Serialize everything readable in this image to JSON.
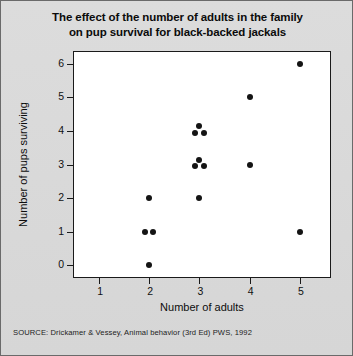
{
  "figure": {
    "title_line1": "The effect of the number of adults in the family",
    "title_line2": "on pup survival for black-backed jackals",
    "source": "SOURCE:   Drickamer & Vessey, Animal behavior (3rd Ed) PWS, 1992",
    "frame_color": "#1a1a1a",
    "marker_color": "#141414",
    "plot_background": "#ffffff",
    "page_background": "#d9d9d9"
  },
  "chart_data": {
    "type": "scatter",
    "title": "The effect of the number of adults in the family on pup survival for black-backed jackals",
    "xlabel": "Number of adults",
    "ylabel": "Number of pups surviving",
    "xlim": [
      0.5,
      5.6
    ],
    "ylim": [
      -0.35,
      6.35
    ],
    "xticks": [
      1,
      2,
      3,
      4,
      5
    ],
    "yticks": [
      0,
      1,
      2,
      3,
      4,
      5,
      6
    ],
    "xtick_labels": [
      "1",
      "2",
      "3",
      "4",
      "5"
    ],
    "ytick_labels": [
      "0",
      "1",
      "2",
      "3",
      "4",
      "5",
      "6"
    ],
    "grid": false,
    "legend": null,
    "n_observations": 14,
    "points": [
      {
        "x": 2,
        "y": 2,
        "dx": 0,
        "dy": 0
      },
      {
        "x": 2,
        "y": 1,
        "dx": -0.08,
        "dy": 0
      },
      {
        "x": 2,
        "y": 1,
        "dx": 0.08,
        "dy": 0
      },
      {
        "x": 2,
        "y": 0,
        "dx": 0,
        "dy": 0
      },
      {
        "x": 3,
        "y": 4,
        "dx": 0,
        "dy": 0.14
      },
      {
        "x": 3,
        "y": 4,
        "dx": -0.08,
        "dy": -0.05
      },
      {
        "x": 3,
        "y": 4,
        "dx": 0.08,
        "dy": -0.05
      },
      {
        "x": 3,
        "y": 3,
        "dx": 0,
        "dy": 0.14
      },
      {
        "x": 3,
        "y": 3,
        "dx": -0.08,
        "dy": -0.05
      },
      {
        "x": 3,
        "y": 3,
        "dx": 0.08,
        "dy": -0.05
      },
      {
        "x": 3,
        "y": 2,
        "dx": 0,
        "dy": 0
      },
      {
        "x": 4,
        "y": 5,
        "dx": 0,
        "dy": 0
      },
      {
        "x": 4,
        "y": 3,
        "dx": 0,
        "dy": 0
      },
      {
        "x": 5,
        "y": 6,
        "dx": 0,
        "dy": 0
      },
      {
        "x": 5,
        "y": 1,
        "dx": 0,
        "dy": 0
      }
    ]
  }
}
